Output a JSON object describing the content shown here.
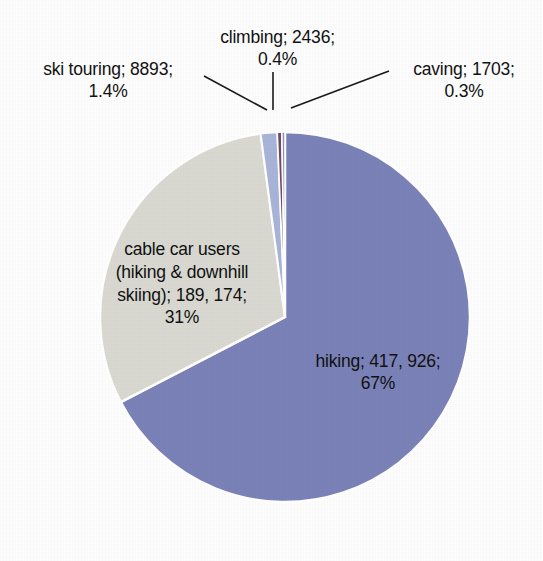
{
  "chart_data": {
    "type": "pie",
    "title": "",
    "subtitle": "",
    "xlabel": "",
    "ylabel": "",
    "legend_position": "none",
    "grid": false,
    "labels_format": "category; value; percent",
    "categories": [
      "hiking",
      "cable car users (hiking & downhill skiing)",
      "ski touring",
      "climbing",
      "caving"
    ],
    "values": [
      417926,
      189174,
      8893,
      2436,
      1703
    ],
    "value_labels": [
      "417, 926",
      "189, 174",
      "8893",
      "2436",
      "1703"
    ],
    "percents": [
      "67%",
      "31%",
      "1.4%",
      "0.4%",
      "0.3%"
    ],
    "percent_values": [
      67,
      31,
      1.4,
      0.4,
      0.3
    ],
    "colors": [
      "#7b82b7",
      "#d9d9d2",
      "#a8b4d8",
      "#6f4a63",
      "#8f93c2"
    ],
    "slices": [
      {
        "name": "hiking",
        "value": 417926,
        "value_label": "417, 926",
        "percent": "67%",
        "color": "#7b82b7",
        "label_text": "hiking; 417, 926;\n67%",
        "label_placement": "inside"
      },
      {
        "name": "cable car users (hiking & downhill skiing)",
        "value": 189174,
        "value_label": "189, 174",
        "percent": "31%",
        "color": "#d9d9d2",
        "label_text": "cable car users\n(hiking & downhill\nskiing); 189, 174;\n31%",
        "label_placement": "inside"
      },
      {
        "name": "ski touring",
        "value": 8893,
        "value_label": "8893",
        "percent": "1.4%",
        "color": "#a8b4d8",
        "label_text": "ski touring; 8893;\n1.4%",
        "label_placement": "outside-left"
      },
      {
        "name": "climbing",
        "value": 2436,
        "value_label": "2436",
        "percent": "0.4%",
        "color": "#6f4a63",
        "label_text": "climbing; 2436;\n0.4%",
        "label_placement": "outside-top"
      },
      {
        "name": "caving",
        "value": 1703,
        "value_label": "1703",
        "percent": "0.3%",
        "color": "#8f93c2",
        "label_text": "caving; 1703;\n0.3%",
        "label_placement": "outside-right"
      }
    ]
  },
  "labels": {
    "ski_touring": "ski touring; 8893;\n1.4%",
    "climbing": "climbing; 2436;\n0.4%",
    "caving": "caving; 1703;\n0.3%",
    "cable_car": "cable car users\n(hiking & downhill\nskiing); 189, 174;\n31%",
    "hiking": "hiking; 417, 926;\n67%"
  },
  "style": {
    "background": "#fdfdfd",
    "text_color": "#111111",
    "leader_line_color": "#1a1a1a",
    "slice_border_color": "#ffffff"
  }
}
